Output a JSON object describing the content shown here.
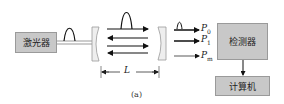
{
  "diagram": {
    "caption": "(a)",
    "laser": {
      "label": "激光器"
    },
    "detector": {
      "label": "检测器"
    },
    "computer": {
      "label": "计算机"
    },
    "cavity_length_label": "L",
    "outputs": [
      {
        "label": "P",
        "sub": "0"
      },
      {
        "label": "P",
        "sub": "1"
      },
      {
        "label": "P",
        "sub": "m"
      }
    ],
    "colors": {
      "box_fill": "#c8c8c8",
      "box_border": "#9a9a9a",
      "mirror_fill": "#eeeeee",
      "line": "#222222"
    }
  }
}
